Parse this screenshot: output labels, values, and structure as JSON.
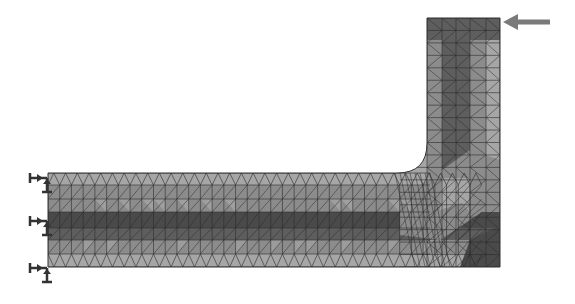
{
  "figure": {
    "geometry": {
      "horizontal_arm": {
        "x0": 48,
        "x1": 500,
        "y0": 173,
        "y1": 267
      },
      "vertical_arm": {
        "x0": 427,
        "x1": 500,
        "y0": 18,
        "y1": 267
      },
      "fillet_radius": 30
    },
    "mesh": {
      "element_type": "triangle",
      "rows_horizontal": 7,
      "cols_horizontal": 36,
      "rows_vertical": 12,
      "cols_vertical": 5
    },
    "load": {
      "icon": "arrow-left-icon",
      "x_start": 550,
      "x_end": 505,
      "y": 22,
      "color": "#7a7a7a"
    },
    "supports": [
      {
        "icon": "fixed-support-icon",
        "y": 178
      },
      {
        "icon": "fixed-support-icon",
        "y": 221
      },
      {
        "icon": "fixed-support-icon",
        "y": 268
      }
    ],
    "colors": {
      "light": "#a6a6a6",
      "mid": "#8c8c8c",
      "dark": "#5e5e5e",
      "darkest": "#4a4a4a",
      "mesh_line": "#2b2b2b",
      "support": "#333333"
    }
  }
}
